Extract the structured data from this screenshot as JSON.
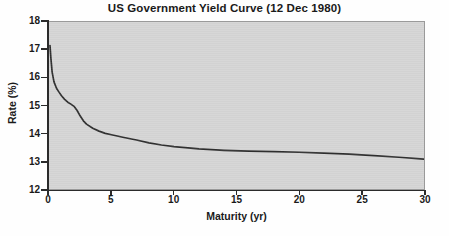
{
  "chart_data": {
    "type": "line",
    "title": "US Government Yield Curve (12 Dec 1980)",
    "xlabel": "Maturity (yr)",
    "ylabel": "Rate (%)",
    "xlim": [
      0,
      30
    ],
    "ylim": [
      12,
      18
    ],
    "xticks": [
      0,
      5,
      10,
      15,
      20,
      25,
      30
    ],
    "yticks": [
      12,
      13,
      14,
      15,
      16,
      17,
      18
    ],
    "xtick_labels": [
      "0",
      "5",
      "10",
      "15",
      "20",
      "25",
      "30"
    ],
    "ytick_labels": [
      "12",
      "13",
      "14",
      "15",
      "16",
      "17",
      "18"
    ],
    "grid": false,
    "legend": null,
    "series": [
      {
        "name": "US Government Yield Curve",
        "color": "#2f2f2f",
        "x": [
          0.08,
          0.15,
          0.25,
          0.4,
          0.6,
          0.8,
          1.0,
          1.25,
          1.5,
          1.75,
          2.0,
          2.25,
          2.5,
          2.75,
          3.0,
          3.5,
          4.0,
          4.5,
          5.0,
          6.0,
          7.0,
          8.0,
          9.0,
          10.0,
          12.0,
          14.0,
          16.0,
          18.0,
          20.0,
          22.0,
          24.0,
          26.0,
          28.0,
          30.0
        ],
        "y": [
          17.15,
          16.7,
          16.2,
          15.85,
          15.62,
          15.48,
          15.35,
          15.22,
          15.12,
          15.05,
          14.97,
          14.82,
          14.62,
          14.45,
          14.33,
          14.18,
          14.08,
          14.0,
          13.95,
          13.85,
          13.76,
          13.66,
          13.58,
          13.52,
          13.44,
          13.39,
          13.36,
          13.34,
          13.32,
          13.29,
          13.25,
          13.2,
          13.14,
          13.07
        ]
      }
    ]
  },
  "axes": {
    "y_title": "Rate (%)",
    "x_title": "Maturity (yr)"
  },
  "colors": {
    "plot_background": "#d5d5d5",
    "curve": "#2f2f2f",
    "axis": "#2b2b2b",
    "text": "#1a1a1a",
    "page_background": "#ffffff"
  }
}
